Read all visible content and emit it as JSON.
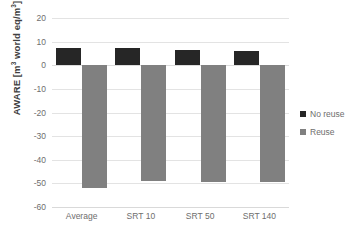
{
  "chart_data": {
    "type": "bar",
    "title": "",
    "subtitle": "",
    "xlabel": "",
    "ylabel": "AWARE [m³ world eq/m³]",
    "ylabel_parts": {
      "prefix": "AWARE [m",
      "sup1": "3",
      "mid": " world eq/m",
      "sup2": "3",
      "suffix": "]"
    },
    "categories": [
      "Average",
      "SRT 10",
      "SRT 50",
      "SRT 140"
    ],
    "series": [
      {
        "name": "No reuse",
        "color": "#262626",
        "values": [
          7.5,
          7.2,
          6.5,
          6.2
        ]
      },
      {
        "name": "Reuse",
        "color": "#808080",
        "values": [
          -52.0,
          -49.0,
          -49.5,
          -49.3
        ]
      }
    ],
    "ylim": [
      -60,
      20
    ],
    "ytick_step": 10,
    "yticks": [
      20,
      10,
      0,
      -10,
      -20,
      -30,
      -40,
      -50,
      -60
    ],
    "ytick_labels": [
      "20",
      "10",
      "0",
      "-10",
      "-20",
      "-30",
      "-40",
      "-50",
      "-60"
    ],
    "grid": {
      "horizontal": true,
      "vertical": false,
      "color": "#e3e3e3"
    },
    "legend": {
      "position": "right",
      "orientation": "vertical",
      "entries": [
        "No reuse",
        "Reuse"
      ]
    },
    "background": "#ffffff",
    "annotations": []
  }
}
